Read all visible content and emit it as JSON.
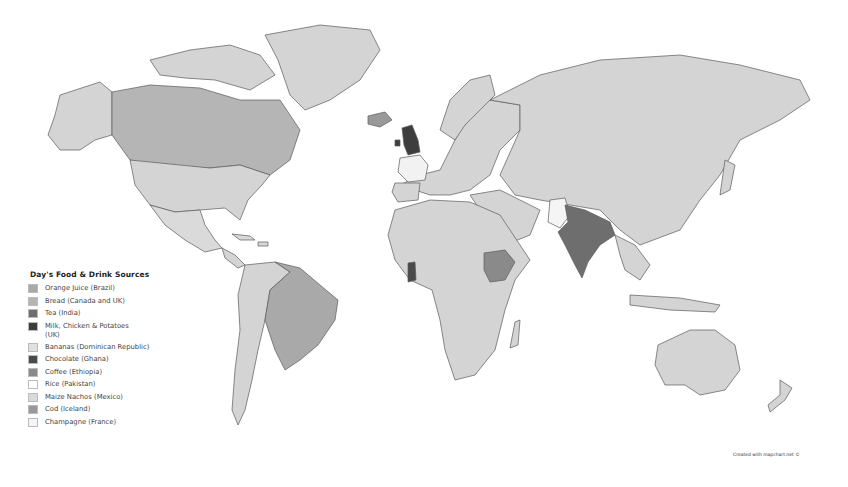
{
  "map": {
    "title": "Day's Food & Drink Sources",
    "default_fill": "#d4d4d4",
    "border_color": "#5a5a5a",
    "highlighted_regions": [
      {
        "country": "Brazil",
        "item": "Orange Juice",
        "color": "#a9a9a9"
      },
      {
        "country": "Canada",
        "item": "Bread",
        "color": "#b5b5b5"
      },
      {
        "country": "United Kingdom",
        "item": "Bread; Milk, Chicken & Potatoes",
        "color": "#3d3d3d"
      },
      {
        "country": "India",
        "item": "Tea",
        "color": "#6e6e6e"
      },
      {
        "country": "Dominican Republic",
        "item": "Bananas",
        "color": "#d8d8d8"
      },
      {
        "country": "Ghana",
        "item": "Chocolate",
        "color": "#4a4a4a"
      },
      {
        "country": "Ethiopia",
        "item": "Coffee",
        "color": "#8a8a8a"
      },
      {
        "country": "Pakistan",
        "item": "Rice",
        "color": "#f5f5f5"
      },
      {
        "country": "Mexico",
        "item": "Maize Nachos",
        "color": "#dadada"
      },
      {
        "country": "Iceland",
        "item": "Cod",
        "color": "#999999"
      },
      {
        "country": "France",
        "item": "Champagne",
        "color": "#f2f2f2"
      }
    ]
  },
  "legend": {
    "title": "Day's Food & Drink Sources",
    "items": [
      {
        "label": "Orange Juice (Brazil)",
        "color": "#a9a9a9"
      },
      {
        "label": "Bread (Canada and UK)",
        "color": "#b5b5b5"
      },
      {
        "label": "Tea (India)",
        "color": "#6e6e6e"
      },
      {
        "label": "Milk, Chicken & Potatoes (UK)",
        "color": "#3d3d3d"
      },
      {
        "label": "Bananas (Dominican Republic)",
        "color": "#e0e0e0"
      },
      {
        "label": "Chocolate (Ghana)",
        "color": "#4a4a4a"
      },
      {
        "label": "Coffee (Ethiopia)",
        "color": "#8a8a8a"
      },
      {
        "label": "Rice (Pakistan)",
        "color": "#ffffff"
      },
      {
        "label": "Maize Nachos (Mexico)",
        "color": "#dadada"
      },
      {
        "label": "Cod (Iceland)",
        "color": "#999999"
      },
      {
        "label": "Champagne (France)",
        "color": "#f5f5f5"
      }
    ]
  },
  "credit": "Created with mapchart.net ©"
}
